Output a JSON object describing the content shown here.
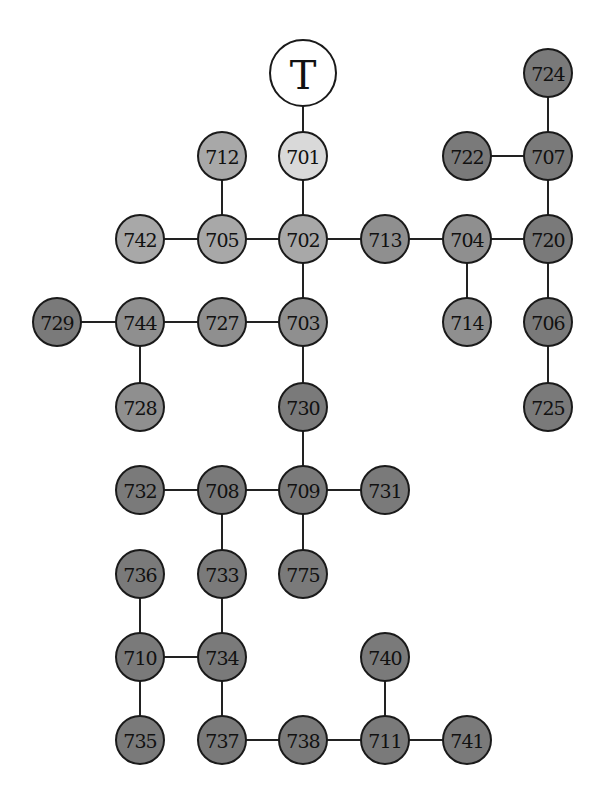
{
  "diagram": {
    "type": "tree",
    "root": {
      "id": "T",
      "label": "T",
      "x": 303,
      "y": 73,
      "r": 33,
      "fill": "#ffffff"
    },
    "shades": {
      "lightest": "#d9d9d9",
      "light": "#a8a8a8",
      "medium": "#8f8f8f",
      "dark": "#7a7a7a"
    },
    "nodes": [
      {
        "id": "701",
        "label": "701",
        "x": 303,
        "y": 156,
        "shade": "lightest"
      },
      {
        "id": "702",
        "label": "702",
        "x": 303,
        "y": 239,
        "shade": "light"
      },
      {
        "id": "712",
        "label": "712",
        "x": 222,
        "y": 156,
        "shade": "light"
      },
      {
        "id": "705",
        "label": "705",
        "x": 222,
        "y": 239,
        "shade": "light"
      },
      {
        "id": "742",
        "label": "742",
        "x": 140,
        "y": 239,
        "shade": "light"
      },
      {
        "id": "713",
        "label": "713",
        "x": 385,
        "y": 239,
        "shade": "medium"
      },
      {
        "id": "704",
        "label": "704",
        "x": 467,
        "y": 239,
        "shade": "medium"
      },
      {
        "id": "714",
        "label": "714",
        "x": 467,
        "y": 322,
        "shade": "medium"
      },
      {
        "id": "720",
        "label": "720",
        "x": 548,
        "y": 239,
        "shade": "dark"
      },
      {
        "id": "707",
        "label": "707",
        "x": 548,
        "y": 156,
        "shade": "dark"
      },
      {
        "id": "724",
        "label": "724",
        "x": 548,
        "y": 73,
        "shade": "dark"
      },
      {
        "id": "722",
        "label": "722",
        "x": 467,
        "y": 156,
        "shade": "dark"
      },
      {
        "id": "706",
        "label": "706",
        "x": 548,
        "y": 322,
        "shade": "dark"
      },
      {
        "id": "725",
        "label": "725",
        "x": 548,
        "y": 407,
        "shade": "dark"
      },
      {
        "id": "703",
        "label": "703",
        "x": 303,
        "y": 322,
        "shade": "medium"
      },
      {
        "id": "727",
        "label": "727",
        "x": 222,
        "y": 322,
        "shade": "medium"
      },
      {
        "id": "744",
        "label": "744",
        "x": 140,
        "y": 322,
        "shade": "medium"
      },
      {
        "id": "729",
        "label": "729",
        "x": 57,
        "y": 322,
        "shade": "dark"
      },
      {
        "id": "728",
        "label": "728",
        "x": 140,
        "y": 407,
        "shade": "medium"
      },
      {
        "id": "730",
        "label": "730",
        "x": 303,
        "y": 407,
        "shade": "dark"
      },
      {
        "id": "709",
        "label": "709",
        "x": 303,
        "y": 490,
        "shade": "dark"
      },
      {
        "id": "731",
        "label": "731",
        "x": 385,
        "y": 490,
        "shade": "dark"
      },
      {
        "id": "708",
        "label": "708",
        "x": 222,
        "y": 490,
        "shade": "dark"
      },
      {
        "id": "732",
        "label": "732",
        "x": 140,
        "y": 490,
        "shade": "dark"
      },
      {
        "id": "775",
        "label": "775",
        "x": 303,
        "y": 574,
        "shade": "dark"
      },
      {
        "id": "733",
        "label": "733",
        "x": 222,
        "y": 574,
        "shade": "dark"
      },
      {
        "id": "736",
        "label": "736",
        "x": 140,
        "y": 574,
        "shade": "dark"
      },
      {
        "id": "734",
        "label": "734",
        "x": 222,
        "y": 657,
        "shade": "dark"
      },
      {
        "id": "710",
        "label": "710",
        "x": 140,
        "y": 657,
        "shade": "dark"
      },
      {
        "id": "735",
        "label": "735",
        "x": 140,
        "y": 740,
        "shade": "dark"
      },
      {
        "id": "737",
        "label": "737",
        "x": 222,
        "y": 740,
        "shade": "dark"
      },
      {
        "id": "738",
        "label": "738",
        "x": 303,
        "y": 740,
        "shade": "dark"
      },
      {
        "id": "711",
        "label": "711",
        "x": 385,
        "y": 740,
        "shade": "dark"
      },
      {
        "id": "740",
        "label": "740",
        "x": 385,
        "y": 657,
        "shade": "dark"
      },
      {
        "id": "741",
        "label": "741",
        "x": 467,
        "y": 740,
        "shade": "dark"
      }
    ],
    "edges": [
      [
        "T",
        "701"
      ],
      [
        "701",
        "702"
      ],
      [
        "702",
        "705"
      ],
      [
        "705",
        "712"
      ],
      [
        "705",
        "742"
      ],
      [
        "702",
        "713"
      ],
      [
        "713",
        "704"
      ],
      [
        "704",
        "714"
      ],
      [
        "704",
        "720"
      ],
      [
        "720",
        "707"
      ],
      [
        "707",
        "724"
      ],
      [
        "707",
        "722"
      ],
      [
        "720",
        "706"
      ],
      [
        "706",
        "725"
      ],
      [
        "702",
        "703"
      ],
      [
        "703",
        "727"
      ],
      [
        "727",
        "744"
      ],
      [
        "744",
        "729"
      ],
      [
        "744",
        "728"
      ],
      [
        "703",
        "730"
      ],
      [
        "730",
        "709"
      ],
      [
        "709",
        "731"
      ],
      [
        "709",
        "708"
      ],
      [
        "708",
        "732"
      ],
      [
        "709",
        "775"
      ],
      [
        "708",
        "733"
      ],
      [
        "733",
        "734"
      ],
      [
        "734",
        "710"
      ],
      [
        "710",
        "736"
      ],
      [
        "710",
        "735"
      ],
      [
        "734",
        "737"
      ],
      [
        "737",
        "738"
      ],
      [
        "738",
        "711"
      ],
      [
        "711",
        "740"
      ],
      [
        "711",
        "741"
      ]
    ],
    "node_radius": 24
  }
}
